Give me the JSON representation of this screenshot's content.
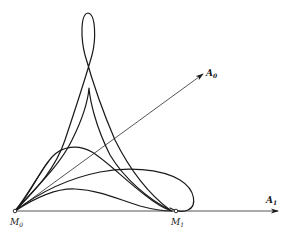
{
  "figure": {
    "type": "geometric diagram of curve family",
    "points": [
      {
        "id": "M0",
        "label": "M",
        "subscript": "0",
        "x": 15,
        "y": 211
      },
      {
        "id": "M1",
        "label": "M",
        "subscript": "1",
        "x": 176,
        "y": 211
      }
    ],
    "vectors": [
      {
        "id": "A0",
        "label": "A",
        "subscript": "0",
        "from": [
          15,
          211
        ],
        "to": [
          203,
          74
        ]
      },
      {
        "id": "A1",
        "label": "A",
        "subscript": "1",
        "from": [
          15,
          211
        ],
        "to": [
          278,
          211
        ]
      }
    ],
    "curves_count": 6,
    "caption": ""
  },
  "colors": {
    "stroke": "#1a1a1a",
    "background": "#ffffff"
  }
}
